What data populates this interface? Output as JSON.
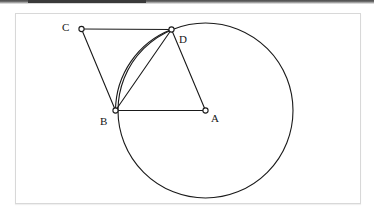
{
  "page": {
    "width": 374,
    "height": 221,
    "background_color": "#ffffff",
    "scan_band_color": "#4a4a4a"
  },
  "figure_frame": {
    "x": 15,
    "y": 13,
    "width": 346,
    "height": 191,
    "border_color": "#d8d8d8",
    "fill_color": "#ffffff"
  },
  "diagram": {
    "stroke_color": "#1a1a1a",
    "stroke_width": 1.1,
    "vertex_marker": {
      "radius": 2.6,
      "fill": "#ffffff",
      "stroke": "#1a1a1a",
      "stroke_width": 1.1
    },
    "circle": {
      "name": "main-circle",
      "center_point": "A",
      "cx": 205.5,
      "cy": 110.5,
      "r": 87.5
    },
    "points": [
      {
        "id": "A",
        "label": "A",
        "x": 205.5,
        "y": 110.5,
        "label_x": 211,
        "label_y": 113,
        "on_circle": false,
        "role": "center"
      },
      {
        "id": "B",
        "label": "B",
        "x": 115.5,
        "y": 110.5,
        "label_x": 100,
        "label_y": 117,
        "on_circle": true,
        "role": "point-on-circle"
      },
      {
        "id": "C",
        "label": "C",
        "x": 81.5,
        "y": 29.0,
        "label_x": 62,
        "label_y": 27,
        "on_circle": false,
        "role": "external-point"
      },
      {
        "id": "D",
        "label": "D",
        "x": 171.5,
        "y": 29.5,
        "label_x": 179,
        "label_y": 39,
        "on_circle": true,
        "role": "point-on-circle"
      }
    ],
    "segments": [
      {
        "name": "segment-CD",
        "from": "C",
        "to": "D"
      },
      {
        "name": "segment-CB",
        "from": "C",
        "to": "B"
      },
      {
        "name": "segment-BD",
        "from": "B",
        "to": "D"
      },
      {
        "name": "segment-BA",
        "from": "B",
        "to": "A"
      },
      {
        "name": "segment-DA",
        "from": "D",
        "to": "A"
      }
    ],
    "arcs": [
      {
        "name": "arc-BD",
        "from": "B",
        "to": "D",
        "description": "minor arc of the main circle running from B up to D on the left side"
      }
    ]
  }
}
